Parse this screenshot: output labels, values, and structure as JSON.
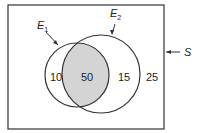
{
  "diagram": {
    "type": "venn",
    "universe_label": "S",
    "sets": [
      {
        "name": "E",
        "subscript": "1"
      },
      {
        "name": "E",
        "subscript": "2"
      }
    ],
    "regions": {
      "e1_only": "10",
      "intersection": "50",
      "e2_only": "15",
      "outside": "25"
    },
    "colors": {
      "stroke": "#333333",
      "intersection_fill": "#d4d4d4",
      "background": "#ffffff"
    }
  }
}
